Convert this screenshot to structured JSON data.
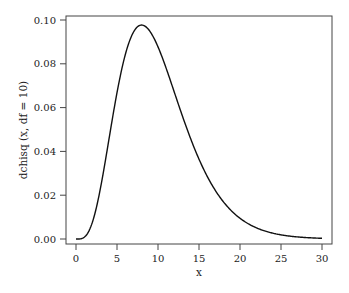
{
  "chart_data": {
    "type": "line",
    "title": "",
    "xlabel": "x",
    "ylabel": "dchisq (x, df = 10)",
    "function": "chi-square density, df = 10",
    "df": 10,
    "xlim": [
      0,
      30
    ],
    "ylim": [
      0,
      0.1
    ],
    "grid": false,
    "legend": null,
    "x_ticks": [
      0,
      5,
      10,
      15,
      20,
      25,
      30
    ],
    "x_tick_labels": [
      "0",
      "5",
      "10",
      "15",
      "20",
      "25",
      "30"
    ],
    "y_ticks": [
      0.0,
      0.02,
      0.04,
      0.06,
      0.08,
      0.1
    ],
    "y_tick_labels": [
      "0.00",
      "0.02",
      "0.04",
      "0.06",
      "0.08",
      "0.10"
    ],
    "series": [
      {
        "name": "dchisq(x, df = 10)",
        "color": "#111111",
        "x": [
          0,
          1,
          2,
          3,
          4,
          5,
          6,
          7,
          8,
          9,
          10,
          11,
          12,
          13,
          14,
          15,
          16,
          17,
          18,
          19,
          20,
          21,
          22,
          23,
          24,
          25,
          26,
          27,
          28,
          29,
          30
        ],
        "y": [
          0.0,
          0.0008,
          0.0077,
          0.0235,
          0.0451,
          0.0668,
          0.084,
          0.0941,
          0.0977,
          0.0958,
          0.0877,
          0.0786,
          0.068,
          0.0572,
          0.0469,
          0.0376,
          0.0297,
          0.023,
          0.0175,
          0.0131,
          0.0097,
          0.0071,
          0.0052,
          0.0037,
          0.0026,
          0.0018,
          0.0013,
          0.0009,
          0.0006,
          0.0004,
          0.0003
        ]
      }
    ],
    "peak": {
      "x": 8,
      "y": 0.0977
    }
  }
}
